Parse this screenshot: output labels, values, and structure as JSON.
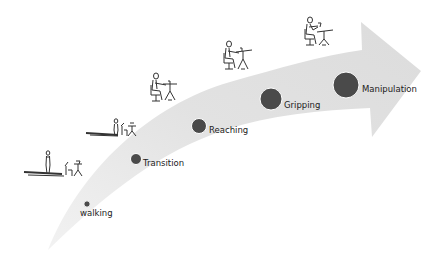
{
  "diagram": {
    "type": "progression-arrow",
    "colors": {
      "arrow_fill": "#e4e4e4",
      "dot_fill": "#4a4a4a",
      "dot_stroke": "#ffffff",
      "label": "#222222",
      "pictogram": "#333333"
    },
    "stages": [
      {
        "label": "walking",
        "order": 1,
        "relative_size": 1
      },
      {
        "label": "Transition",
        "order": 2,
        "relative_size": 2
      },
      {
        "label": "Reaching",
        "order": 3,
        "relative_size": 3
      },
      {
        "label": "Gripping",
        "order": 4,
        "relative_size": 4
      },
      {
        "label": "Manipulation",
        "order": 5,
        "relative_size": 5
      }
    ],
    "pictograms": [
      {
        "name": "person-walking-to-desk",
        "stage": "walking"
      },
      {
        "name": "person-approaching-desk",
        "stage": "Transition"
      },
      {
        "name": "person-seated-at-desk-reaching",
        "stage": "Reaching"
      },
      {
        "name": "person-seated-at-desk-gripping",
        "stage": "Gripping"
      },
      {
        "name": "person-seated-at-desk-manipulating",
        "stage": "Manipulation"
      }
    ]
  }
}
